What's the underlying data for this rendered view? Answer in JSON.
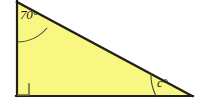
{
  "figure": {
    "kind": "right-triangle-angle-diagram",
    "background_color": "#FFFFFF",
    "fill_color": "#F7F782",
    "stroke_color": "#221F1A",
    "arc_color": "#4A4636",
    "right_angle_marker_color": "#6E6A3C",
    "vertices": {
      "apex_top_left": {
        "x": 17,
        "y": 2
      },
      "right_angle_bottom_left": {
        "x": 17,
        "y": 96
      },
      "acute_bottom_right": {
        "x": 192,
        "y": 96
      }
    },
    "labels": {
      "top_angle": "70°",
      "bottom_right_angle": "c°",
      "right_angle_marker": "90° square"
    },
    "angles": [
      {
        "name": "top-left",
        "value": "70°",
        "measured": 70
      },
      {
        "name": "bottom-left",
        "value": "90°",
        "measured": 90
      },
      {
        "name": "bottom-right",
        "value": "c°",
        "measured": null
      }
    ]
  }
}
